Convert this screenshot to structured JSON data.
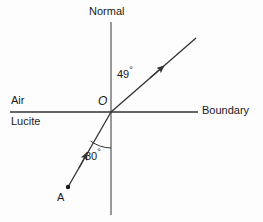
{
  "diagram": {
    "stroke_color": "#333333",
    "text_color": "#1a1a1a",
    "background": "#fdfdfd",
    "width": 263,
    "height": 222,
    "labels": {
      "normal": "Normal",
      "air": "Air",
      "lucite": "Lucite",
      "boundary": "Boundary",
      "origin": "O",
      "angle_refracted": "49",
      "angle_incident": "30",
      "degree_symbol": "°",
      "point_a": "A"
    },
    "geometry": {
      "origin": {
        "x": 111,
        "y": 112
      },
      "normal_line": {
        "x1": 111,
        "y1": 22,
        "x2": 111,
        "y2": 215
      },
      "boundary_line": {
        "x1": 10,
        "y1": 112,
        "x2": 198,
        "y2": 112
      },
      "refracted_ray": {
        "x1": 111,
        "y1": 112,
        "x2": 196,
        "y2": 38
      },
      "incident_ray": {
        "x1": 68,
        "y1": 187,
        "x2": 111,
        "y2": 112
      },
      "point_a_dot": {
        "x": 68,
        "y": 187,
        "r": 2.2
      },
      "arc_30_radius": 36
    },
    "physics": {
      "angle_of_incidence_deg": 30,
      "angle_of_refraction_deg": 49,
      "medium_upper": "Air",
      "medium_lower": "Lucite",
      "incident_ray_origin": "A",
      "boundary_point": "O"
    }
  }
}
